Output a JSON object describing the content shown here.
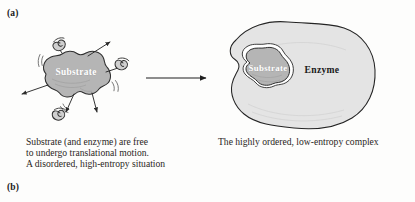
{
  "figure": {
    "panels": [
      {
        "label": "(a)"
      },
      {
        "label": "(b)"
      }
    ]
  },
  "left_scene": {
    "substrate_label": "Substrate",
    "caption": "Substrate (and enzyme) are free\nto undergo translational motion.\nA disordered, high-entropy situation"
  },
  "right_scene": {
    "substrate_label": "Substrate",
    "enzyme_label": "Enzyme",
    "caption": "The highly ordered, low-entropy complex"
  },
  "arrow": {
    "name": "reaction-arrow"
  },
  "colors": {
    "page_background": "#fdfdfc",
    "substrate_fill": "#b5b5b5",
    "substrate_stroke": "#2e2e2e",
    "enzyme_fill": "#e4e4e4",
    "enzyme_stroke": "#242424",
    "text": "#2a2623",
    "label_on_blob": "#ffffff",
    "enzyme_label_text": "#1a1a1a",
    "molecule_fill": "#cfcfcf",
    "arrow_stroke": "#1f1f1f"
  }
}
